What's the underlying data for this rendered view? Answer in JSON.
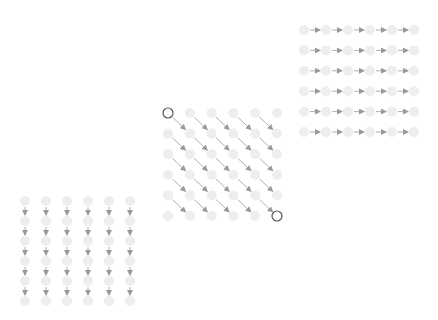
{
  "diagram": {
    "title": "",
    "colors": {
      "node_fill": "#eeeeee",
      "edge": "#9a9a9a",
      "highlight_stroke": "#555555",
      "background": "#ffffff"
    },
    "grids": [
      {
        "id": "row-grid",
        "rows": 6,
        "cols": 6,
        "edge_direction": "right",
        "highlighted_nodes": []
      },
      {
        "id": "diagonal-grid",
        "rows": 6,
        "cols": 6,
        "edge_direction": "down-right",
        "highlighted_nodes": [
          [
            0,
            0
          ],
          [
            5,
            5
          ]
        ]
      },
      {
        "id": "column-grid",
        "rows": 6,
        "cols": 6,
        "edge_direction": "down",
        "highlighted_nodes": []
      }
    ]
  }
}
